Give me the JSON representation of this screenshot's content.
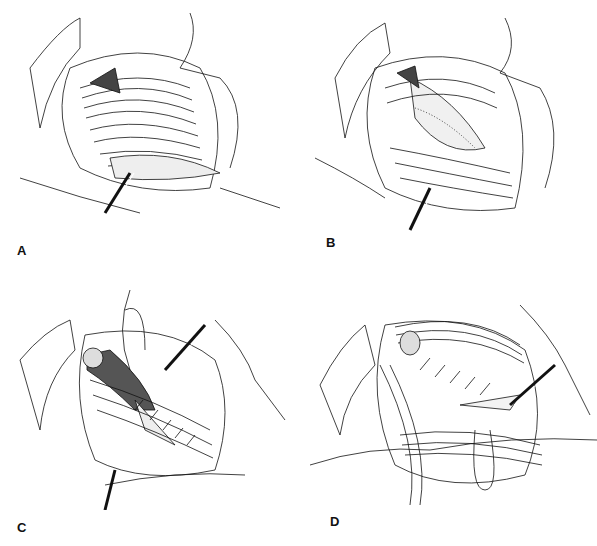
{
  "figure": {
    "panels": [
      {
        "id": "A",
        "label": "A",
        "description": "Exposure of inguinal canal with retracted structures, floor shown"
      },
      {
        "id": "B",
        "label": "B",
        "description": "Floor opened, stippled tissue exposed"
      },
      {
        "id": "C",
        "label": "C",
        "description": "Suture placement with retractor, interrupted stitches"
      },
      {
        "id": "D",
        "label": "D",
        "description": "Repair completed with sutures, retractor in place"
      }
    ],
    "colors": {
      "ink": "#111111",
      "background": "#ffffff"
    }
  }
}
